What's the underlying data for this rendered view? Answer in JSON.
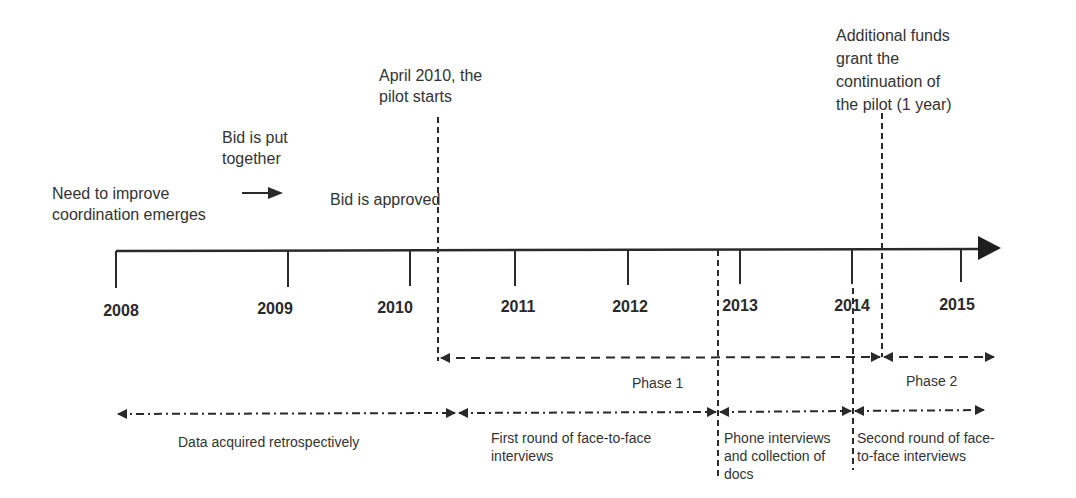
{
  "diagram": {
    "type": "timeline",
    "axis": {
      "years": [
        "2008",
        "2009",
        "2010",
        "2011",
        "2012",
        "2013",
        "2014",
        "2015"
      ],
      "year_positions_x": [
        116,
        288,
        410,
        515,
        628,
        740,
        852,
        961
      ]
    },
    "events": {
      "need": "Need to improve\ncoordination emerges",
      "bid_put_together": "Bid is put\ntogether",
      "bid_approved": "Bid is approved",
      "pilot_start": "April 2010, the\npilot starts",
      "additional_funds": "Additional funds\ngrant the\ncontinuation of\nthe pilot (1 year)"
    },
    "phases": {
      "phase1": "Phase 1",
      "phase2": "Phase 2"
    },
    "data_collection": {
      "retrospective": "Data acquired retrospectively",
      "first_round": "First round of face-to-face\ninterviews",
      "phone": "Phone interviews\nand collection of\ndocs",
      "second_round": "Second round of face-\nto-face interviews"
    },
    "colors": {
      "line": "#2a2a2a",
      "text": "#333333",
      "background": "#ffffff"
    }
  }
}
